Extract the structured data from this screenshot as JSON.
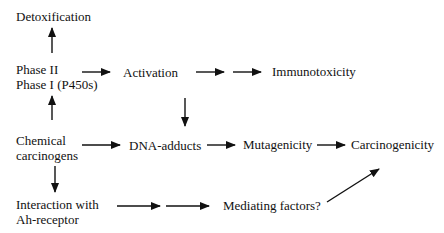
{
  "diagram": {
    "nodes": {
      "detoxification": "Detoxification",
      "phase2": "Phase II",
      "phase1": "Phase I (P450s)",
      "activation": "Activation",
      "immunotoxicity": "Immunotoxicity",
      "chemical_line1": "Chemical",
      "chemical_line2": "carcinogens",
      "dna_adducts": "DNA-adducts",
      "mutagenicity": "Mutagenicity",
      "carcinogenicity": "Carcinogenicity",
      "ah_line1": "Interaction with",
      "ah_line2": "Ah-receptor",
      "mediating": "Mediating factors?"
    },
    "edges": [
      {
        "from": "Phase II / Phase I (P450s)",
        "to": "Detoxification"
      },
      {
        "from": "Phase II / Phase I (P450s)",
        "to": "Activation"
      },
      {
        "from": "Activation",
        "to": "Immunotoxicity"
      },
      {
        "from": "Activation",
        "to": "DNA-adducts"
      },
      {
        "from": "Chemical carcinogens",
        "to": "Phase II / Phase I (P450s)"
      },
      {
        "from": "Chemical carcinogens",
        "to": "DNA-adducts"
      },
      {
        "from": "Chemical carcinogens",
        "to": "Interaction with Ah-receptor"
      },
      {
        "from": "DNA-adducts",
        "to": "Mutagenicity"
      },
      {
        "from": "Mutagenicity",
        "to": "Carcinogenicity"
      },
      {
        "from": "Interaction with Ah-receptor",
        "to": "Mediating factors?"
      },
      {
        "from": "Mediating factors?",
        "to": "Carcinogenicity"
      }
    ]
  }
}
